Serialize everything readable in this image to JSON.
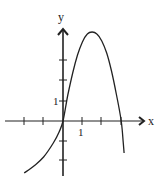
{
  "chart_data": {
    "type": "line",
    "title": "",
    "xlabel": "x",
    "ylabel": "y",
    "x_tick_values": [
      -3,
      -2,
      -1,
      1,
      2,
      3
    ],
    "y_tick_values": [
      -3,
      -2,
      -1,
      1,
      2,
      3,
      4
    ],
    "x_tick_labels": [
      {
        "value": 1,
        "label": "1"
      }
    ],
    "y_tick_labels": [
      {
        "value": 1,
        "label": "1"
      }
    ],
    "xlim": [
      -3.2,
      4.2
    ],
    "ylim": [
      -3.0,
      4.6
    ],
    "grid": false,
    "legend": null,
    "series": [
      {
        "name": "f(x)",
        "description": "Curve rising from lower-left, passing through origin, peaking near (1.5, 4.5), crossing x-axis at 3, then dropping steeply",
        "points": [
          {
            "x": -2.0,
            "y": -2.6
          },
          {
            "x": -1.5,
            "y": -2.25
          },
          {
            "x": -1.0,
            "y": -1.8
          },
          {
            "x": -0.5,
            "y": -1.1
          },
          {
            "x": -0.2,
            "y": -0.55
          },
          {
            "x": 0.0,
            "y": 0.0
          },
          {
            "x": 0.25,
            "y": 1.3
          },
          {
            "x": 0.5,
            "y": 2.4
          },
          {
            "x": 0.75,
            "y": 3.3
          },
          {
            "x": 1.0,
            "y": 3.95
          },
          {
            "x": 1.25,
            "y": 4.35
          },
          {
            "x": 1.5,
            "y": 4.45
          },
          {
            "x": 1.75,
            "y": 4.35
          },
          {
            "x": 2.0,
            "y": 4.0
          },
          {
            "x": 2.25,
            "y": 3.4
          },
          {
            "x": 2.5,
            "y": 2.5
          },
          {
            "x": 2.75,
            "y": 1.35
          },
          {
            "x": 3.0,
            "y": 0.0
          },
          {
            "x": 3.1,
            "y": -1.0
          },
          {
            "x": 3.15,
            "y": -1.6
          }
        ]
      }
    ],
    "annotations": {
      "x_axis_arrow": true,
      "y_axis_arrow": true
    }
  },
  "labels": {
    "x_axis": "x",
    "y_axis": "y",
    "x_tick_one": "1",
    "y_tick_one": "1"
  }
}
